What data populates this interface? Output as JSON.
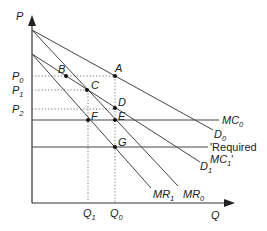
{
  "diagram": {
    "type": "economics-monopoly-demand-shift",
    "axes": {
      "y_label": "P",
      "x_label": "Q"
    },
    "price_levels": [
      {
        "label": "P",
        "sub": "0",
        "y": 76
      },
      {
        "label": "P",
        "sub": "1",
        "y": 90
      },
      {
        "label": "P",
        "sub": "2",
        "y": 109
      }
    ],
    "quantity_levels": [
      {
        "label": "Q",
        "sub": "1",
        "x": 88
      },
      {
        "label": "Q",
        "sub": "0",
        "x": 115
      }
    ],
    "curves": {
      "D0": {
        "label": "D",
        "sub": "0"
      },
      "D1": {
        "label": "D",
        "sub": "1"
      },
      "MR0": {
        "label": "MR",
        "sub": "0"
      },
      "MR1": {
        "label": "MR",
        "sub": "1"
      },
      "MC0": {
        "label": "MC",
        "sub": "0"
      },
      "MC1": {
        "label_line1": "'Required",
        "label_line2": "MC",
        "sub": "1",
        "suffix": "'"
      }
    },
    "points": [
      "A",
      "B",
      "C",
      "D",
      "E",
      "F",
      "G"
    ]
  }
}
